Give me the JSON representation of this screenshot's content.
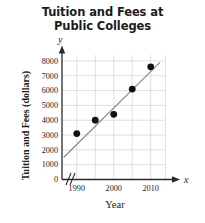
{
  "chart_data": {
    "type": "scatter",
    "title": "Tuition and Fees at Public Colleges",
    "title_line1": "Tuition and Fees at",
    "title_line2": "Public Colleges",
    "xlabel": "Year",
    "ylabel": "Tuition and Fees (dollars)",
    "x_axis_variable": "x",
    "y_axis_variable": "y",
    "xlim": [
      1986,
      2014
    ],
    "ylim": [
      0,
      8400
    ],
    "x_ticks": [
      1990,
      2000,
      2010
    ],
    "x_tick_labels": [
      "1990",
      "2000",
      "2010"
    ],
    "x_gridlines": [
      1990,
      1995,
      2000,
      2005,
      2010
    ],
    "y_ticks": [
      0,
      1000,
      2000,
      3000,
      4000,
      5000,
      6000,
      7000,
      8000
    ],
    "y_tick_labels": [
      "0",
      "1000",
      "2000",
      "3000",
      "4000",
      "5000",
      "6000",
      "7000",
      "8000"
    ],
    "grid": true,
    "axis_break": "x-axis break between 0 and 1990",
    "legend": "none",
    "x": [
      1990,
      1995,
      2000,
      2005,
      2010
    ],
    "values": [
      3100,
      4000,
      4400,
      6100,
      7600
    ],
    "points": [
      {
        "x": 1990,
        "y": 3100
      },
      {
        "x": 1995,
        "y": 4000
      },
      {
        "x": 2000,
        "y": 4400
      },
      {
        "x": 2005,
        "y": 6100
      },
      {
        "x": 2010,
        "y": 7600
      }
    ],
    "trend_line": {
      "label": "line of best fit",
      "x_start": 1986.5,
      "y_start": 1500,
      "x_end": 2012.5,
      "y_end": 7900,
      "color": "#8a8a8a"
    },
    "colors": {
      "point": "#111111",
      "grid": "#d8d8d8",
      "axis": "#2a2a2a",
      "trend": "#8a8a8a",
      "background": "#ffffff"
    }
  }
}
